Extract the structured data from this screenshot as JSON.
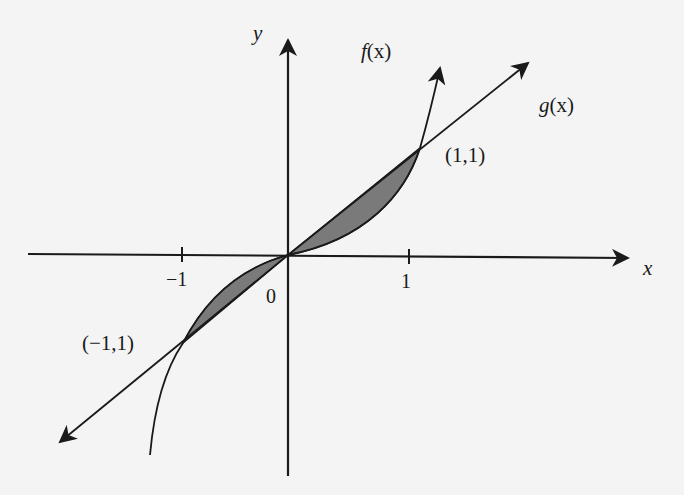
{
  "figure": {
    "type": "function-graph",
    "axes": {
      "x_label": "x",
      "y_label": "y",
      "ticks": [
        "-1",
        "0",
        "1"
      ],
      "tick_labels": {
        "neg_one": "−1",
        "zero": "0",
        "one": "1"
      }
    },
    "curves": {
      "f": {
        "label": "f(x)",
        "label_name": "f",
        "label_arg": "(x)"
      },
      "g": {
        "label": "g(x)",
        "label_name": "g",
        "label_arg": "(x)"
      }
    },
    "points": {
      "p1": {
        "label": "(1,1)"
      },
      "p2": {
        "label": "(−1,1)"
      }
    },
    "shaded_regions": [
      "between f and g from -1 to 0",
      "between f and g from 0 to 1"
    ],
    "colors": {
      "background": "#f4f4f4",
      "stroke": "#1a1a1a",
      "shade": "#7a7a7a"
    }
  }
}
